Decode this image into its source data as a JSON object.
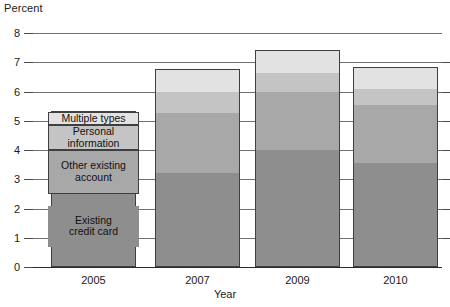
{
  "chart_data": {
    "type": "bar",
    "subtype": "stacked-bar",
    "title": "",
    "xlabel": "Year",
    "ylabel": "Percent",
    "categories": [
      "2005",
      "2007",
      "2009",
      "2010"
    ],
    "ylim": [
      0,
      8
    ],
    "yticks": [
      0,
      1,
      2,
      3,
      4,
      5,
      6,
      7,
      8
    ],
    "ytick_labels": [
      "0",
      "1",
      "2",
      "3",
      "4",
      "5",
      "6",
      "7",
      "8"
    ],
    "grid": true,
    "grid_axis": "y",
    "legend_position": "inside-first-bar",
    "stack_order_bottom_to_top": [
      "Existing credit card",
      "Other existing account",
      "Personal information",
      "Multiple types"
    ],
    "series": [
      {
        "name": "Existing credit card",
        "color": "#8e8e8e",
        "values": [
          2.5,
          3.2,
          4.0,
          3.55
        ]
      },
      {
        "name": "Other existing account",
        "color": "#a8a8a8",
        "values": [
          1.5,
          2.05,
          2.0,
          2.0
        ]
      },
      {
        "name": "Personal information",
        "color": "#c4c4c4",
        "values": [
          0.85,
          0.75,
          0.65,
          0.55
        ]
      },
      {
        "name": "Multiple types",
        "color": "#e2e2e2",
        "values": [
          0.45,
          0.75,
          0.75,
          0.7
        ]
      }
    ],
    "totals": [
      5.3,
      6.75,
      7.4,
      6.8
    ]
  },
  "axes": {
    "y_title": "Percent",
    "x_title": "Year",
    "y_ticks": [
      "8",
      "7",
      "6",
      "5",
      "4",
      "3",
      "2",
      "1",
      "0"
    ],
    "x_ticks": [
      "2005",
      "2007",
      "2009",
      "2010"
    ]
  },
  "legend": {
    "items": [
      {
        "label": "Multiple types",
        "color": "#e2e2e2"
      },
      {
        "label": "Personal information",
        "color": "#c4c4c4"
      },
      {
        "label": "Other existing account",
        "color": "#a8a8a8"
      },
      {
        "label": "Existing credit card",
        "color": "#8e8e8e"
      }
    ],
    "item0_line1": "Multiple types",
    "item1_line1": "Personal",
    "item1_line2": "information",
    "item2_line1": "Other existing",
    "item2_line2": "account",
    "item3_line1": "Existing",
    "item3_line2": "credit card"
  },
  "colors": {
    "multiple_types": "#e2e2e2",
    "personal_information": "#c4c4c4",
    "other_existing_account": "#a8a8a8",
    "existing_credit_card": "#8e8e8e",
    "outline": "#3f3f3f",
    "gridline": "#6f6f6f",
    "text": "#1a1a1a",
    "background": "#ffffff"
  }
}
